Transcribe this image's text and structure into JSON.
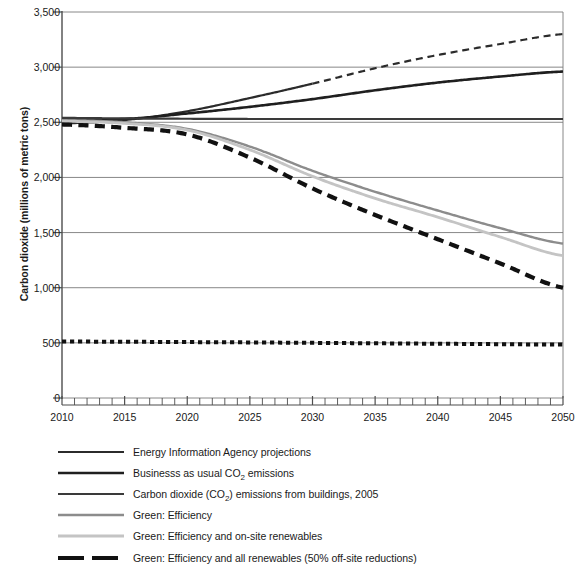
{
  "chart_data": {
    "type": "line",
    "title": "",
    "xlabel": "",
    "ylabel": "Carbon dioxide (millions of metric tons)",
    "xlim": [
      2010,
      2050
    ],
    "ylim": [
      0,
      3500
    ],
    "ytick_values": [
      0,
      500,
      1000,
      1500,
      2000,
      2500,
      3000,
      3500
    ],
    "ytick_labels": [
      "0",
      "500",
      "1,000",
      "1,500",
      "2,000",
      "2,500",
      "3,000",
      "3,500"
    ],
    "xtick_values": [
      2010,
      2015,
      2020,
      2025,
      2030,
      2035,
      2040,
      2045,
      2050
    ],
    "xtick_labels": [
      "2010",
      "2015",
      "2020",
      "2025",
      "2030",
      "2035",
      "2040",
      "2045",
      "2050"
    ],
    "x_minor_tick_step": 1,
    "grid": "horizontal",
    "legend_position": "below",
    "x": [
      2010,
      2015,
      2020,
      2025,
      2030,
      2035,
      2040,
      2045,
      2050
    ],
    "series": [
      {
        "name": "Energy Information Agency projections",
        "key": "eia",
        "color": "#2b2b2b",
        "width": 2.2,
        "dash": "solid-then-dashed",
        "dash_starts_at": 2030,
        "values": [
          2490,
          2520,
          2600,
          2720,
          2850,
          2990,
          3110,
          3210,
          3300
        ]
      },
      {
        "name": "Businesss as usual CO2 emissions",
        "key": "bau",
        "color": "#1f1f1f",
        "width": 2.6,
        "dash": "solid",
        "values": [
          2530,
          2530,
          2580,
          2640,
          2710,
          2790,
          2860,
          2915,
          2960
        ]
      },
      {
        "name": "Carbon dioxide (CO2) emissions from buildings, 2005",
        "key": "buildings2005",
        "color": "#3a3a3a",
        "width": 2.2,
        "dash": "solid",
        "values": [
          2540,
          2535,
          2532,
          2530,
          2530,
          2530,
          2530,
          2530,
          2530
        ]
      },
      {
        "name": "Green: Efficiency",
        "key": "green_efficiency",
        "color": "#8c8c8c",
        "width": 2.4,
        "dash": "solid",
        "values": [
          2520,
          2500,
          2440,
          2280,
          2060,
          1870,
          1700,
          1540,
          1400
        ]
      },
      {
        "name": "Green: Efficiency and on-site renewables",
        "key": "green_onsite",
        "color": "#c4c4c4",
        "width": 2.8,
        "dash": "solid",
        "values": [
          2510,
          2490,
          2430,
          2250,
          2010,
          1810,
          1640,
          1460,
          1290
        ]
      },
      {
        "name": "Green: Efficiency and all renewables (50% off-site reductions)",
        "key": "green_all",
        "color": "#111111",
        "width": 4.2,
        "dash": "dashed",
        "values": [
          2480,
          2450,
          2390,
          2180,
          1900,
          1660,
          1440,
          1220,
          1000
        ]
      },
      {
        "name": "baseline-dotted",
        "key": "baseline_dotted",
        "color": "#111111",
        "width": 4.0,
        "dash": "dotted",
        "in_legend": false,
        "values": [
          512,
          510,
          507,
          504,
          500,
          496,
          492,
          488,
          484
        ]
      }
    ]
  },
  "legend": {
    "items": [
      {
        "label_before": "Energy Information Agency projections",
        "label_sub": "",
        "label_after": "",
        "series_key": "eia"
      },
      {
        "label_before": "Businesss as usual CO",
        "label_sub": "2",
        "label_after": " emissions",
        "series_key": "bau"
      },
      {
        "label_before": "Carbon dioxide (CO",
        "label_sub": "2",
        "label_after": ") emissions from buildings, 2005",
        "series_key": "buildings2005"
      },
      {
        "label_before": "Green: Efficiency",
        "label_sub": "",
        "label_after": "",
        "series_key": "green_efficiency"
      },
      {
        "label_before": "Green: Efficiency and on-site renewables",
        "label_sub": "",
        "label_after": "",
        "series_key": "green_onsite"
      },
      {
        "label_before": "Green: Efficiency and all renewables (50% off-site reductions)",
        "label_sub": "",
        "label_after": "",
        "series_key": "green_all"
      }
    ]
  },
  "colors": {
    "axis": "#4d4d4d",
    "grid": "#7a7a7a",
    "text": "#1a1a1a",
    "background": "#ffffff"
  }
}
